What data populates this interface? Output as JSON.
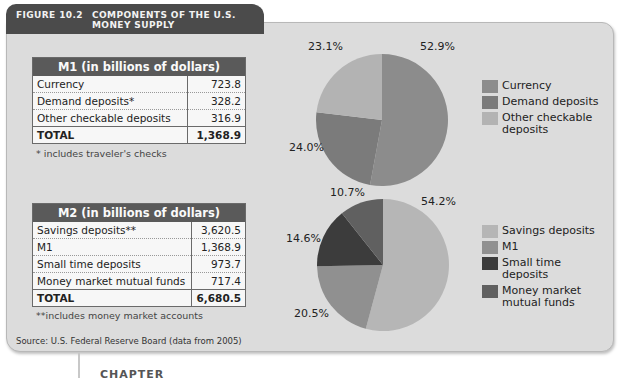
{
  "figure": {
    "number": "FIGURE 10.2",
    "title": "COMPONENTS OF THE U.S. MONEY SUPPLY",
    "source": "Source: U.S. Federal Reserve Board (data from 2005)"
  },
  "m1_table": {
    "header": "M1 (in billions of dollars)",
    "rows": [
      {
        "label": "Currency",
        "value": "723.8"
      },
      {
        "label": "Demand deposits*",
        "value": "328.2"
      },
      {
        "label": "Other checkable deposits",
        "value": "316.9"
      }
    ],
    "total_label": "TOTAL",
    "total_value": "1,368.9",
    "note": "* includes traveler's checks"
  },
  "m2_table": {
    "header": "M2 (in billions of dollars)",
    "rows": [
      {
        "label": "Savings deposits**",
        "value": "3,620.5"
      },
      {
        "label": "M1",
        "value": "1,368.9"
      },
      {
        "label": "Small time deposits",
        "value": "973.7"
      },
      {
        "label": "Money market mutual funds",
        "value": "717.4"
      }
    ],
    "total_label": "TOTAL",
    "total_value": "6,680.5",
    "note": "**includes money market accounts"
  },
  "chart_data": [
    {
      "type": "pie",
      "title": "M1",
      "categories": [
        "Currency",
        "Demand deposits",
        "Other checkable deposits"
      ],
      "values": [
        52.9,
        24.0,
        23.1
      ],
      "labels": [
        "52.9%",
        "24.0%",
        "23.1%"
      ],
      "colors": [
        "#8c8c8c",
        "#7b7b7b",
        "#b3b3b3"
      ],
      "legend": [
        "Currency",
        "Demand deposits",
        "Other checkable deposits"
      ],
      "legend_position": "right"
    },
    {
      "type": "pie",
      "title": "M2",
      "categories": [
        "Savings deposits",
        "M1",
        "Small time deposits",
        "Money market mutual funds"
      ],
      "values": [
        54.2,
        20.5,
        14.6,
        10.7
      ],
      "labels": [
        "54.2%",
        "20.5%",
        "14.6%",
        "10.7%"
      ],
      "colors": [
        "#b6b6b6",
        "#909090",
        "#3c3c3c",
        "#606060"
      ],
      "legend": [
        "Savings deposits",
        "M1",
        "Small time deposits",
        "Money market mutual funds"
      ],
      "legend_position": "right"
    }
  ],
  "below_text": "CHAPTER TOPICS"
}
